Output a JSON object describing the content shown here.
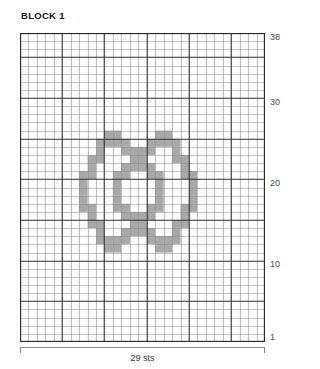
{
  "chart_data": {
    "type": "heatmap",
    "title": "BLOCK 1",
    "xlabel": "29 sts",
    "ylabel": "",
    "columns": 29,
    "rows": 38,
    "grid_origin": "bottom-left",
    "row_tick_labels": [
      "38",
      "30",
      "20",
      "10",
      "1"
    ],
    "row_tick_values": [
      38,
      30,
      20,
      10,
      1
    ],
    "xlim": [
      1,
      29
    ],
    "ylim": [
      1,
      38
    ],
    "grid": true,
    "legend": "",
    "colors": {
      "filled_cell": "#a8a8a8",
      "empty_cell": "#fdfdfd",
      "minor_gridline": "#8f8f8f",
      "major_gridline": "#333333",
      "border": "#2b2b2b"
    },
    "major_gridline_every": 5,
    "annotations": [],
    "filled_cells": [
      [
        12,
        11
      ],
      [
        12,
        12
      ],
      [
        12,
        17
      ],
      [
        12,
        18
      ],
      [
        13,
        10
      ],
      [
        13,
        11
      ],
      [
        13,
        12
      ],
      [
        13,
        13
      ],
      [
        13,
        16
      ],
      [
        13,
        17
      ],
      [
        13,
        18
      ],
      [
        13,
        19
      ],
      [
        14,
        10
      ],
      [
        14,
        13
      ],
      [
        14,
        14
      ],
      [
        14,
        15
      ],
      [
        14,
        16
      ],
      [
        14,
        19
      ],
      [
        15,
        9
      ],
      [
        15,
        10
      ],
      [
        15,
        14
      ],
      [
        15,
        15
      ],
      [
        15,
        19
      ],
      [
        15,
        20
      ],
      [
        16,
        9
      ],
      [
        16,
        13
      ],
      [
        16,
        14
      ],
      [
        16,
        15
      ],
      [
        16,
        16
      ],
      [
        16,
        20
      ],
      [
        17,
        8
      ],
      [
        17,
        9
      ],
      [
        17,
        12
      ],
      [
        17,
        13
      ],
      [
        17,
        16
      ],
      [
        17,
        17
      ],
      [
        17,
        20
      ],
      [
        17,
        21
      ],
      [
        18,
        8
      ],
      [
        18,
        12
      ],
      [
        18,
        17
      ],
      [
        18,
        21
      ],
      [
        19,
        8
      ],
      [
        19,
        12
      ],
      [
        19,
        17
      ],
      [
        19,
        21
      ],
      [
        20,
        8
      ],
      [
        20,
        12
      ],
      [
        20,
        17
      ],
      [
        20,
        21
      ],
      [
        21,
        8
      ],
      [
        21,
        9
      ],
      [
        21,
        12
      ],
      [
        21,
        13
      ],
      [
        21,
        16
      ],
      [
        21,
        17
      ],
      [
        21,
        20
      ],
      [
        21,
        21
      ],
      [
        22,
        9
      ],
      [
        22,
        13
      ],
      [
        22,
        14
      ],
      [
        22,
        15
      ],
      [
        22,
        16
      ],
      [
        22,
        20
      ],
      [
        23,
        9
      ],
      [
        23,
        10
      ],
      [
        23,
        14
      ],
      [
        23,
        15
      ],
      [
        23,
        19
      ],
      [
        23,
        20
      ],
      [
        24,
        10
      ],
      [
        24,
        13
      ],
      [
        24,
        14
      ],
      [
        24,
        15
      ],
      [
        24,
        16
      ],
      [
        24,
        19
      ],
      [
        25,
        10
      ],
      [
        25,
        11
      ],
      [
        25,
        12
      ],
      [
        25,
        13
      ],
      [
        25,
        16
      ],
      [
        25,
        17
      ],
      [
        25,
        18
      ],
      [
        25,
        19
      ],
      [
        26,
        11
      ],
      [
        26,
        12
      ],
      [
        26,
        17
      ],
      [
        26,
        18
      ]
    ]
  },
  "chart": {
    "title": "BLOCK 1",
    "width_label": "29 sts"
  }
}
